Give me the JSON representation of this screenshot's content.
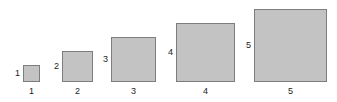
{
  "figure": {
    "background_color": "#ffffff",
    "square_fill_color": "#c3c3c3",
    "square_border_color": "#7d7d7d",
    "label_color": "#1c1c1c",
    "baseline_y": 82,
    "squares": [
      {
        "index": 1,
        "side_label": "1",
        "bottom_label": "1",
        "size": 17,
        "left": 23,
        "top": 65
      },
      {
        "index": 2,
        "side_label": "2",
        "bottom_label": "2",
        "size": 31,
        "left": 62,
        "top": 51
      },
      {
        "index": 3,
        "side_label": "3",
        "bottom_label": "3",
        "size": 45,
        "left": 111,
        "top": 37
      },
      {
        "index": 4,
        "side_label": "4",
        "bottom_label": "4",
        "size": 59,
        "left": 176,
        "top": 23
      },
      {
        "index": 5,
        "side_label": "5",
        "bottom_label": "5",
        "size": 73,
        "left": 254,
        "top": 9
      }
    ]
  },
  "chart_data": {
    "type": "bar",
    "title": "",
    "subtitle": "",
    "xlabel": "",
    "ylabel": "",
    "grid": false,
    "legend": "none",
    "categories": [
      "1",
      "2",
      "3",
      "4",
      "5"
    ],
    "values": [
      1,
      2,
      3,
      4,
      5
    ],
    "series": [
      {
        "name": "square side length",
        "values": [
          1,
          2,
          3,
          4,
          5
        ]
      }
    ],
    "annotations": [
      {
        "text": "1",
        "position": "left-of-square-1"
      },
      {
        "text": "2",
        "position": "left-of-square-2"
      },
      {
        "text": "3",
        "position": "left-of-square-3"
      },
      {
        "text": "4",
        "position": "left-of-square-4"
      },
      {
        "text": "5",
        "position": "left-of-square-5"
      },
      {
        "text": "1",
        "position": "below-square-1"
      },
      {
        "text": "2",
        "position": "below-square-2"
      },
      {
        "text": "3",
        "position": "below-square-3"
      },
      {
        "text": "4",
        "position": "below-square-4"
      },
      {
        "text": "5",
        "position": "below-square-5"
      }
    ],
    "xlim": [
      0,
      6
    ],
    "ylim": [
      0,
      6
    ],
    "tick_labels_x": [
      "1",
      "2",
      "3",
      "4",
      "5"
    ],
    "tick_labels_y": [
      "1",
      "2",
      "3",
      "4",
      "5"
    ]
  }
}
